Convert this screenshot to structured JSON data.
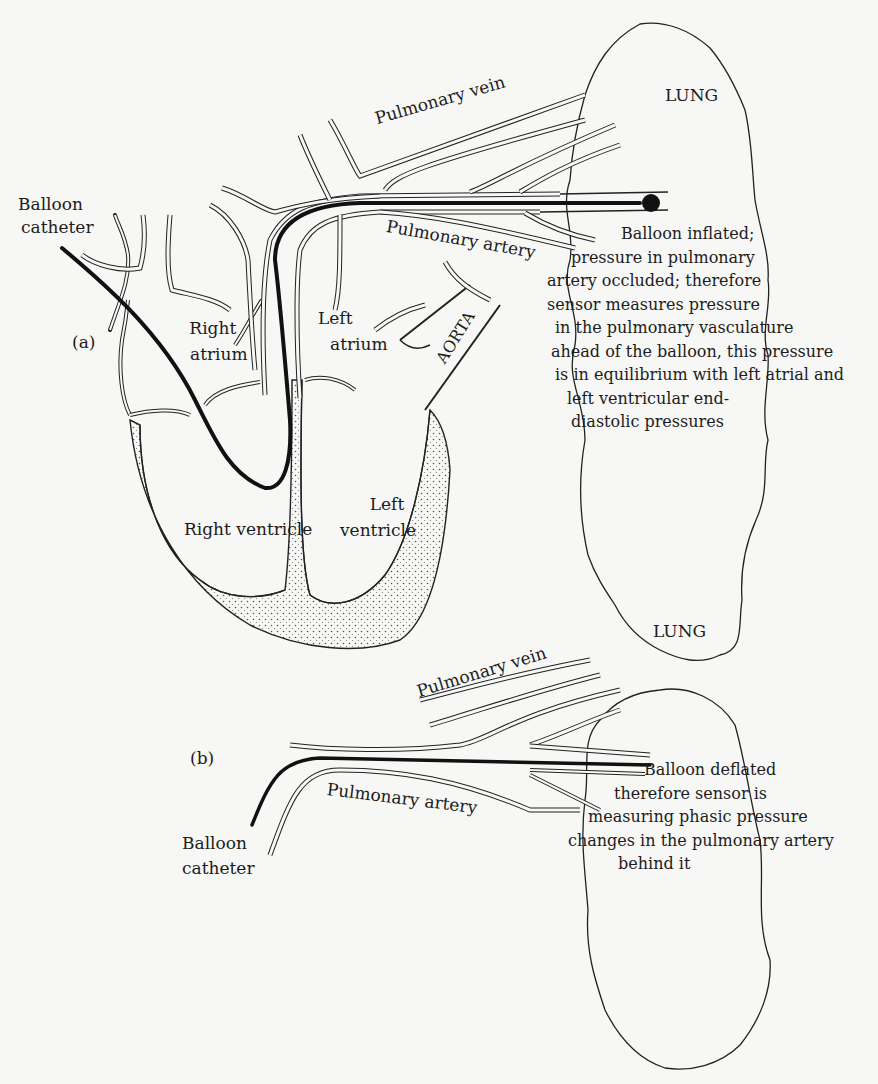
{
  "panel_a": {
    "marker": "(a)",
    "catheter_label_1": "Balloon",
    "catheter_label_2": "catheter",
    "pulmonary_vein": "Pulmonary vein",
    "pulmonary_artery": "Pulmonary artery",
    "lung": "LUNG",
    "aorta": "AORTA",
    "right_atrium_1": "Right",
    "right_atrium_2": "atrium",
    "left_atrium_1": "Left",
    "left_atrium_2": "atrium",
    "right_ventricle": "Right ventricle",
    "left_ventricle_1": "Left",
    "left_ventricle_2": "ventricle",
    "note_lines": [
      "Balloon inflated;",
      "pressure in pulmonary",
      "artery occluded; therefore",
      "sensor measures pressure",
      "in the pulmonary vasculature",
      "ahead of the balloon, this pressure",
      "is in equilibrium with left atrial and",
      "left ventricular end-",
      "diastolic pressures"
    ]
  },
  "panel_b": {
    "marker": "(b)",
    "lung": "LUNG",
    "pulmonary_vein": "Pulmonary vein",
    "pulmonary_artery": "Pulmonary artery",
    "catheter_label_1": "Balloon",
    "catheter_label_2": "catheter",
    "note_lines": [
      "Balloon deflated",
      "therefore sensor is",
      "measuring phasic pressure",
      "changes in the pulmonary artery",
      "behind it"
    ]
  },
  "colors": {
    "background": "#f7f7f5",
    "ink": "#1a1a1a"
  }
}
